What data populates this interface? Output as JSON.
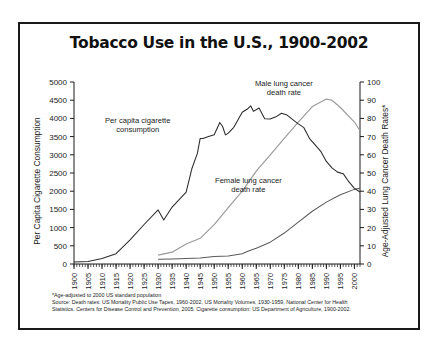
{
  "title": "Tobacco Use in the U.S., 1900-2002",
  "axes": {
    "left_title": "Per Capita Cigarette Consumption",
    "right_title": "Age-Adjusted Lung Cancer Death Rates*",
    "left_ticks": [
      "0",
      "500",
      "1000",
      "1500",
      "2000",
      "2500",
      "3000",
      "3500",
      "4000",
      "4500",
      "5000"
    ],
    "right_ticks": [
      "0",
      "10",
      "20",
      "30",
      "40",
      "50",
      "60",
      "70",
      "80",
      "90",
      "100"
    ],
    "x_ticks": [
      "1900",
      "1905",
      "1910",
      "1915",
      "1920",
      "1925",
      "1930",
      "1935",
      "1940",
      "1945",
      "1950",
      "1955",
      "1960",
      "1965",
      "1970",
      "1975",
      "1980",
      "1985",
      "1990",
      "1995",
      "2000"
    ]
  },
  "annotations": {
    "consumption_line1": "Per capita cigarette",
    "consumption_line2": "consumption",
    "male_line1": "Male lung cancer",
    "male_line2": "death rate",
    "female_line1": "Female lung cancer",
    "female_line2": "death rate"
  },
  "footnotes": {
    "line1": "*Age-adjusted to 2000 US standard population",
    "line2": "Source: Death rates: US Mortality Public Use Tapes, 1960-2002, US Mortality Volumes, 1930-1959, National Center for Health",
    "line3": "Statistics. Centers for Disease Control and Prevention, 2005. Cigarette consumption: US Department of Agriculture, 1900-2002."
  },
  "colors": {
    "frame": "#1a1a1a",
    "consumption_line": "#2b2b2b",
    "male_line": "#9a9a9a",
    "female_line": "#5a5a5a",
    "text": "#1a1a1a",
    "background": "#ffffff"
  },
  "chart_data": {
    "type": "line",
    "title": "Tobacco Use in the U.S., 1900-2002",
    "xlabel": "",
    "ylabel": "Per Capita Cigarette Consumption",
    "y2label": "Age-Adjusted Lung Cancer Death Rates*",
    "xlim": [
      1900,
      2002
    ],
    "ylim": [
      0,
      5000
    ],
    "y2lim": [
      0,
      100
    ],
    "grid": false,
    "legend": "annotations-on-plot",
    "series": [
      {
        "name": "Per capita cigarette consumption",
        "axis": "left",
        "color": "#2b2b2b",
        "x": [
          1900,
          1905,
          1910,
          1915,
          1920,
          1925,
          1930,
          1932,
          1935,
          1940,
          1942,
          1944,
          1945,
          1946,
          1948,
          1950,
          1952,
          1953,
          1954,
          1955,
          1957,
          1960,
          1962,
          1963,
          1964,
          1966,
          1968,
          1970,
          1972,
          1974,
          1976,
          1978,
          1980,
          1982,
          1984,
          1986,
          1988,
          1990,
          1992,
          1994,
          1996,
          1998,
          2000,
          2002
        ],
        "values": [
          54,
          70,
          151,
          285,
          665,
          1085,
          1485,
          1210,
          1564,
          1976,
          2609,
          3039,
          3449,
          3446,
          3505,
          3552,
          3886,
          3778,
          3546,
          3597,
          3755,
          4171,
          4266,
          4345,
          4194,
          4287,
          3993,
          3985,
          4043,
          4141,
          4092,
          3965,
          3851,
          3746,
          3446,
          3274,
          3096,
          2817,
          2640,
          2524,
          2482,
          2261,
          2076,
          1979
        ]
      },
      {
        "name": "Male lung cancer death rate",
        "axis": "right",
        "color": "#9a9a9a",
        "x": [
          1930,
          1935,
          1940,
          1945,
          1950,
          1955,
          1960,
          1965,
          1970,
          1975,
          1980,
          1985,
          1990,
          1992,
          1995,
          2000,
          2002
        ],
        "values": [
          4.9,
          6.5,
          11.0,
          14.1,
          21.6,
          31.0,
          40.0,
          51.0,
          60.0,
          69.0,
          78.0,
          86.5,
          90.6,
          90.0,
          86.0,
          78.0,
          73.2
        ]
      },
      {
        "name": "Female lung cancer death rate",
        "axis": "right",
        "color": "#5a5a5a",
        "x": [
          1930,
          1935,
          1940,
          1945,
          1950,
          1955,
          1960,
          1962,
          1965,
          1970,
          1975,
          1980,
          1985,
          1990,
          1995,
          2000,
          2002
        ],
        "values": [
          2.6,
          2.8,
          3.0,
          3.3,
          4.1,
          4.4,
          5.6,
          7.0,
          8.7,
          12.0,
          17.0,
          23.0,
          29.0,
          34.0,
          38.0,
          41.0,
          41.6
        ]
      }
    ]
  }
}
